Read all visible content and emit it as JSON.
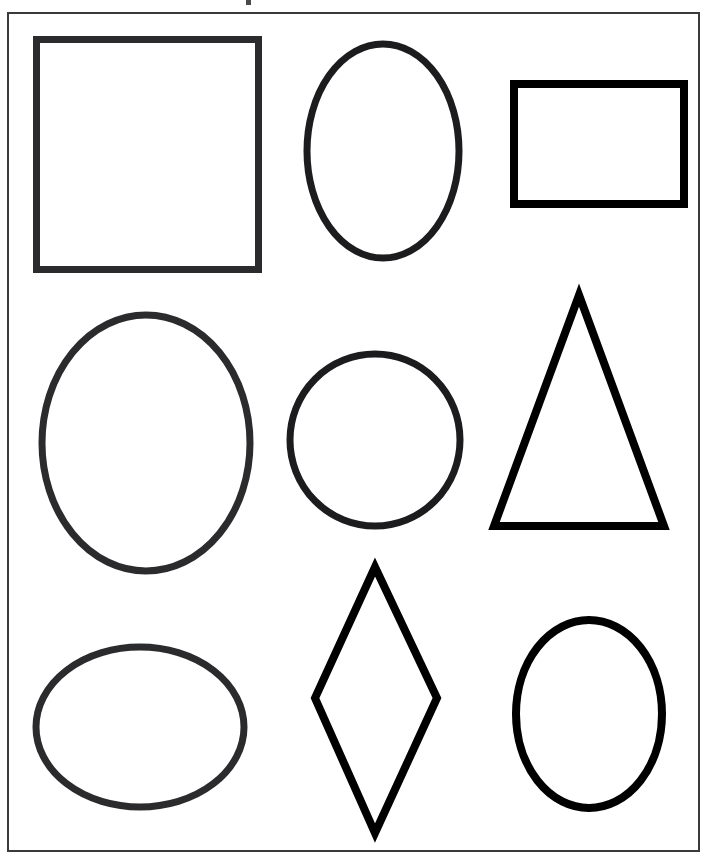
{
  "page": {
    "width": 710,
    "height": 859,
    "background_color": "#ffffff",
    "ink_color": "#000000",
    "border_color": "#3a3a3c"
  },
  "sheet": {
    "border_label": "worksheet-frame",
    "x": 7,
    "y": 12,
    "width": 693,
    "height": 840,
    "border_width": 2
  },
  "artifact": {
    "name": "scan-speck",
    "x": 246,
    "y": 0,
    "size": 5,
    "color": "#4a4a4c"
  },
  "grid": {
    "rows": 3,
    "cols": 3,
    "total_shapes": 9
  },
  "shapes": [
    {
      "id": "shape-1",
      "name": "square",
      "label": "Square",
      "row": 1,
      "col": 1,
      "kind": "rect",
      "x": 31,
      "y": 38,
      "width": 215,
      "height": 223,
      "stroke": 7,
      "color": "#2b2b2d"
    },
    {
      "id": "shape-2",
      "name": "oval-tall",
      "label": "Oval",
      "row": 1,
      "col": 2,
      "kind": "ellipse",
      "cx": 381,
      "cy": 139,
      "rx": 76,
      "ry": 107,
      "stroke": 7,
      "color": "#1c1c1e"
    },
    {
      "id": "shape-3",
      "name": "rectangle",
      "label": "Rectangle",
      "row": 1,
      "col": 3,
      "kind": "rect",
      "x": 508,
      "y": 78,
      "width": 170,
      "height": 120,
      "stroke": 8,
      "color": "#000000"
    },
    {
      "id": "shape-4",
      "name": "oval-large",
      "label": "Oval",
      "row": 2,
      "col": 1,
      "kind": "ellipse",
      "cx": 144,
      "cy": 429,
      "rx": 104,
      "ry": 128,
      "stroke": 7,
      "color": "#2b2b2d"
    },
    {
      "id": "shape-5",
      "name": "circle",
      "label": "Circle",
      "row": 2,
      "col": 2,
      "kind": "ellipse",
      "cx": 373,
      "cy": 426,
      "rx": 85,
      "ry": 86,
      "stroke": 7,
      "color": "#1c1c1e"
    },
    {
      "id": "shape-6",
      "name": "triangle",
      "label": "Triangle",
      "row": 2,
      "col": 3,
      "kind": "polygon",
      "points": "577,289 662,520 492,520",
      "stroke": 8,
      "color": "#000000"
    },
    {
      "id": "shape-7",
      "name": "oval-wide",
      "label": "Oval",
      "row": 3,
      "col": 1,
      "kind": "ellipse",
      "cx": 138,
      "cy": 713,
      "rx": 104,
      "ry": 80,
      "stroke": 7,
      "color": "#2b2b2d"
    },
    {
      "id": "shape-8",
      "name": "rhombus",
      "label": "Rhombus",
      "row": 3,
      "col": 2,
      "kind": "polygon",
      "points": "373,561 435,692 373,827 313,692",
      "stroke": 8,
      "color": "#000000"
    },
    {
      "id": "shape-9",
      "name": "oval-small",
      "label": "Oval",
      "row": 3,
      "col": 3,
      "kind": "ellipse",
      "cx": 587,
      "cy": 706,
      "rx": 73,
      "ry": 94,
      "stroke": 8,
      "color": "#000000"
    }
  ]
}
